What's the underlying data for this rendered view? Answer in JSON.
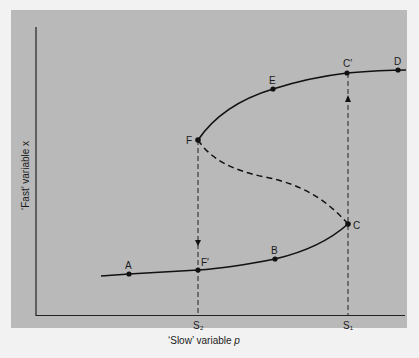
{
  "figure": {
    "type": "fold-bifurcation-hysteresis-diagram",
    "colors": {
      "panel_bg": "#b9b9b9",
      "page_bg": "#f2f2f2",
      "ink": "#111111"
    },
    "axes": {
      "x_label": "‘Slow’ variable p",
      "x_label_main": "‘Slow’ variable ",
      "x_label_var": "p",
      "y_label": "‘Fast’ variable x",
      "x_ticks": [
        {
          "label": "S₂",
          "x": 198
        },
        {
          "label": "S₁",
          "x": 348
        }
      ]
    },
    "points": [
      {
        "id": "A",
        "label": "A",
        "x": 129,
        "y": 274
      },
      {
        "id": "F_prime",
        "label": "F′",
        "x": 198,
        "y": 270
      },
      {
        "id": "B",
        "label": "B",
        "x": 275,
        "y": 259
      },
      {
        "id": "C",
        "label": "C",
        "x": 348,
        "y": 224
      },
      {
        "id": "F",
        "label": "F",
        "x": 198,
        "y": 140
      },
      {
        "id": "E",
        "label": "E",
        "x": 273,
        "y": 89
      },
      {
        "id": "C_prime",
        "label": "C′",
        "x": 347,
        "y": 73
      },
      {
        "id": "D",
        "label": "D",
        "x": 398,
        "y": 70
      }
    ],
    "branches": {
      "lower_stable": "solid",
      "middle_unstable": "dashed",
      "upper_stable": "solid"
    },
    "jumps": [
      {
        "from": "C",
        "to": "C′",
        "direction": "up",
        "at": "S₁"
      },
      {
        "from": "F",
        "to": "F′",
        "direction": "down",
        "at": "S₂"
      }
    ]
  }
}
